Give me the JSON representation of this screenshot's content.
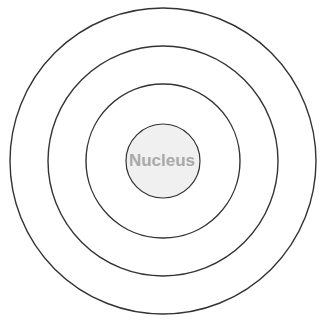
{
  "diagram": {
    "type": "concentric-circles",
    "center": {
      "x": 163,
      "y": 161
    },
    "stroke_color": "#333333",
    "nucleus": {
      "label": "Nucleus",
      "radius": 37,
      "fill": "#f0f0f0",
      "text_color": "#a9a9a9"
    },
    "shells": [
      {
        "radius": 77
      },
      {
        "radius": 115
      },
      {
        "radius": 153
      }
    ]
  }
}
